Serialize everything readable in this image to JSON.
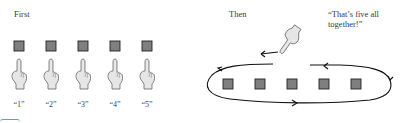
{
  "left_panel": {
    "heading": "First",
    "items": [
      {
        "count": "“1”"
      },
      {
        "count": "“2”"
      },
      {
        "count": "“3”"
      },
      {
        "count": "“4”"
      },
      {
        "count": "“5”"
      }
    ]
  },
  "right_panel": {
    "heading": "Then",
    "speech": "“That’s five all together!”",
    "speech_line1": "“That’s five all",
    "speech_line2": "together!”",
    "square_count": 5
  },
  "colors": {
    "square_fill": "#7f7f7f",
    "square_stroke": "#222222",
    "hand_fill": "#e6e6e6",
    "hand_stroke": "#555555",
    "accent": "#5aa89a"
  }
}
